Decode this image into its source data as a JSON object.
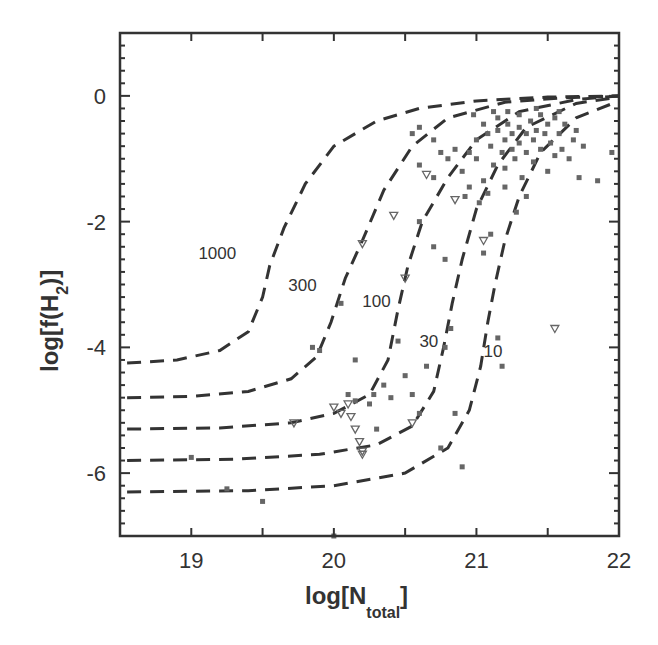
{
  "chart_data": {
    "type": "scatter",
    "title": "",
    "xlabel": "log[N_total]",
    "xlabel_main": "log[N",
    "xlabel_sub": "total",
    "xlabel_close": "]",
    "ylabel": "log[f(H_2)]",
    "ylabel_main": "log[f(H",
    "ylabel_sub": "2",
    "ylabel_close": ")]",
    "xlim": [
      18.5,
      22
    ],
    "ylim": [
      -7,
      1
    ],
    "x_ticks": [
      19,
      20,
      21,
      22
    ],
    "x_tick_labels": [
      "19",
      "20",
      "21",
      "22"
    ],
    "y_ticks": [
      0,
      -2,
      -4,
      -6
    ],
    "y_tick_labels": [
      "0",
      "-2",
      "-4",
      "-6"
    ],
    "grid": false,
    "legend": null,
    "model_curves": [
      {
        "label": "1000",
        "label_pos": [
          19.05,
          -2.6
        ],
        "points": [
          [
            18.55,
            -4.25
          ],
          [
            18.9,
            -4.2
          ],
          [
            19.2,
            -4.05
          ],
          [
            19.4,
            -3.75
          ],
          [
            19.5,
            -3.2
          ],
          [
            19.55,
            -2.7
          ],
          [
            19.65,
            -2.1
          ],
          [
            19.8,
            -1.4
          ],
          [
            20.0,
            -0.8
          ],
          [
            20.3,
            -0.4
          ],
          [
            20.6,
            -0.2
          ],
          [
            21.0,
            -0.08
          ],
          [
            21.5,
            -0.02
          ],
          [
            22.0,
            0.0
          ]
        ]
      },
      {
        "label": "300",
        "label_pos": [
          19.68,
          -3.1
        ],
        "points": [
          [
            18.55,
            -4.8
          ],
          [
            19.0,
            -4.78
          ],
          [
            19.4,
            -4.7
          ],
          [
            19.7,
            -4.5
          ],
          [
            19.88,
            -4.15
          ],
          [
            19.98,
            -3.6
          ],
          [
            20.08,
            -2.9
          ],
          [
            20.2,
            -2.3
          ],
          [
            20.35,
            -1.5
          ],
          [
            20.55,
            -0.8
          ],
          [
            20.8,
            -0.35
          ],
          [
            21.2,
            -0.1
          ],
          [
            21.6,
            -0.03
          ],
          [
            22.0,
            0.0
          ]
        ]
      },
      {
        "label": "100",
        "label_pos": [
          20.2,
          -3.35
        ],
        "points": [
          [
            18.55,
            -5.3
          ],
          [
            19.2,
            -5.28
          ],
          [
            19.7,
            -5.2
          ],
          [
            20.0,
            -5.05
          ],
          [
            20.25,
            -4.75
          ],
          [
            20.38,
            -4.2
          ],
          [
            20.45,
            -3.4
          ],
          [
            20.52,
            -2.7
          ],
          [
            20.62,
            -2.0
          ],
          [
            20.8,
            -1.3
          ],
          [
            21.0,
            -0.7
          ],
          [
            21.3,
            -0.25
          ],
          [
            21.7,
            -0.06
          ],
          [
            22.0,
            0.0
          ]
        ]
      },
      {
        "label": "30",
        "label_pos": [
          20.6,
          -4.0
        ],
        "points": [
          [
            18.55,
            -5.8
          ],
          [
            19.3,
            -5.78
          ],
          [
            19.9,
            -5.7
          ],
          [
            20.3,
            -5.55
          ],
          [
            20.55,
            -5.25
          ],
          [
            20.7,
            -4.7
          ],
          [
            20.77,
            -4.0
          ],
          [
            20.83,
            -3.3
          ],
          [
            20.9,
            -2.6
          ],
          [
            21.0,
            -1.8
          ],
          [
            21.15,
            -1.1
          ],
          [
            21.35,
            -0.5
          ],
          [
            21.7,
            -0.12
          ],
          [
            22.0,
            -0.02
          ]
        ]
      },
      {
        "label": "10",
        "label_pos": [
          21.05,
          -4.15
        ],
        "points": [
          [
            18.55,
            -6.3
          ],
          [
            19.4,
            -6.28
          ],
          [
            20.0,
            -6.2
          ],
          [
            20.5,
            -6.0
          ],
          [
            20.8,
            -5.6
          ],
          [
            20.95,
            -5.0
          ],
          [
            21.03,
            -4.3
          ],
          [
            21.08,
            -3.6
          ],
          [
            21.13,
            -3.0
          ],
          [
            21.2,
            -2.3
          ],
          [
            21.3,
            -1.6
          ],
          [
            21.45,
            -0.9
          ],
          [
            21.7,
            -0.35
          ],
          [
            22.0,
            -0.08
          ]
        ]
      }
    ],
    "series": [
      {
        "name": "detections",
        "marker": "square",
        "points": [
          [
            19.0,
            -5.75
          ],
          [
            19.25,
            -6.25
          ],
          [
            19.5,
            -6.45
          ],
          [
            20.0,
            -7.0
          ],
          [
            19.85,
            -4.0
          ],
          [
            19.9,
            -4.05
          ],
          [
            20.05,
            -3.3
          ],
          [
            20.1,
            -4.75
          ],
          [
            20.15,
            -4.85
          ],
          [
            20.3,
            -5.3
          ],
          [
            20.15,
            -4.2
          ],
          [
            20.45,
            -3.9
          ],
          [
            20.35,
            -4.6
          ],
          [
            20.4,
            -4.8
          ],
          [
            20.25,
            -4.9
          ],
          [
            20.28,
            -4.75
          ],
          [
            20.5,
            -4.45
          ],
          [
            20.55,
            -4.75
          ],
          [
            20.6,
            -5.05
          ],
          [
            20.65,
            -4.3
          ],
          [
            20.78,
            -4.0
          ],
          [
            20.82,
            -3.7
          ],
          [
            20.75,
            -5.6
          ],
          [
            20.85,
            -5.05
          ],
          [
            20.9,
            -5.9
          ],
          [
            21.15,
            -3.85
          ],
          [
            21.18,
            -4.3
          ],
          [
            20.6,
            -1.1
          ],
          [
            20.7,
            -1.3
          ],
          [
            20.6,
            -2.0
          ],
          [
            20.7,
            -2.4
          ],
          [
            20.78,
            -2.6
          ],
          [
            20.92,
            -1.6
          ],
          [
            20.95,
            -1.45
          ],
          [
            21.05,
            -2.5
          ],
          [
            21.1,
            -2.2
          ],
          [
            20.55,
            -0.6
          ],
          [
            20.6,
            -0.5
          ],
          [
            20.7,
            -0.7
          ],
          [
            20.75,
            -0.9
          ],
          [
            20.8,
            -1.0
          ],
          [
            20.85,
            -0.85
          ],
          [
            20.9,
            -1.2
          ],
          [
            20.95,
            -0.9
          ],
          [
            21.0,
            -1.0
          ],
          [
            21.0,
            -0.7
          ],
          [
            21.05,
            -0.45
          ],
          [
            21.05,
            -1.35
          ],
          [
            21.08,
            -0.6
          ],
          [
            21.1,
            -0.8
          ],
          [
            21.12,
            -1.1
          ],
          [
            21.15,
            -0.35
          ],
          [
            21.15,
            -0.55
          ],
          [
            21.18,
            -0.9
          ],
          [
            21.2,
            -0.7
          ],
          [
            21.2,
            -1.15
          ],
          [
            21.22,
            -0.45
          ],
          [
            21.25,
            -0.6
          ],
          [
            21.25,
            -0.85
          ],
          [
            21.27,
            -1.0
          ],
          [
            21.3,
            -0.3
          ],
          [
            21.3,
            -0.5
          ],
          [
            21.3,
            -0.75
          ],
          [
            21.32,
            -1.3
          ],
          [
            21.35,
            -0.6
          ],
          [
            21.35,
            -0.9
          ],
          [
            21.38,
            -0.4
          ],
          [
            21.4,
            -0.7
          ],
          [
            21.4,
            -1.05
          ],
          [
            21.42,
            -0.55
          ],
          [
            21.45,
            -0.3
          ],
          [
            21.45,
            -0.85
          ],
          [
            21.48,
            -0.6
          ],
          [
            21.5,
            -1.2
          ],
          [
            21.5,
            -0.45
          ],
          [
            21.52,
            -0.75
          ],
          [
            21.55,
            -0.95
          ],
          [
            21.55,
            -0.35
          ],
          [
            21.58,
            -0.6
          ],
          [
            21.6,
            -0.85
          ],
          [
            21.62,
            -0.45
          ],
          [
            21.65,
            -1.0
          ],
          [
            21.68,
            -0.7
          ],
          [
            21.7,
            -0.55
          ],
          [
            21.72,
            -1.3
          ],
          [
            21.75,
            -0.8
          ],
          [
            21.85,
            -1.35
          ],
          [
            21.95,
            -0.9
          ],
          [
            21.02,
            -1.7
          ],
          [
            21.08,
            -1.55
          ],
          [
            21.2,
            -1.45
          ],
          [
            21.35,
            -1.6
          ],
          [
            21.28,
            -1.85
          ],
          [
            21.22,
            -0.25
          ],
          [
            21.42,
            -0.2
          ],
          [
            21.12,
            -0.25
          ],
          [
            20.98,
            -0.3
          ],
          [
            21.58,
            -0.25
          ]
        ]
      },
      {
        "name": "upper limits",
        "marker": "triangle-down",
        "points": [
          [
            19.72,
            -5.2
          ],
          [
            20.0,
            -4.95
          ],
          [
            20.05,
            -5.05
          ],
          [
            20.1,
            -4.9
          ],
          [
            20.12,
            -5.1
          ],
          [
            20.15,
            -5.3
          ],
          [
            20.18,
            -5.5
          ],
          [
            20.2,
            -5.65
          ],
          [
            20.55,
            -5.2
          ],
          [
            20.2,
            -2.35
          ],
          [
            20.5,
            -2.9
          ],
          [
            20.85,
            -1.65
          ],
          [
            20.42,
            -1.9
          ],
          [
            21.05,
            -2.3
          ],
          [
            21.55,
            -3.7
          ],
          [
            20.65,
            -1.25
          ],
          [
            20.2,
            -5.7
          ]
        ]
      }
    ]
  }
}
